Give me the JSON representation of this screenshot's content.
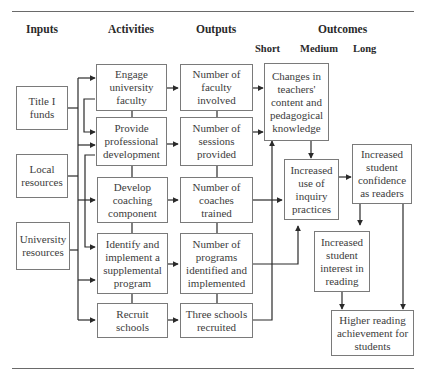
{
  "headers": {
    "inputs": "Inputs",
    "activities": "Activities",
    "outputs": "Outputs",
    "outcomes": "Outcomes",
    "short": "Short",
    "medium": "Medium",
    "long": "Long"
  },
  "inputs": [
    {
      "label": "Title I funds"
    },
    {
      "label": "Local resources"
    },
    {
      "label": "University resources"
    }
  ],
  "activities": [
    {
      "label": "Engage university faculty"
    },
    {
      "label": "Provide professional development"
    },
    {
      "label": "Develop coaching component"
    },
    {
      "label": "Identify and implement a supplemental program"
    },
    {
      "label": "Recruit schools"
    }
  ],
  "outputs": [
    {
      "label": "Number of faculty involved"
    },
    {
      "label": "Number of sessions provided"
    },
    {
      "label": "Number of coaches trained"
    },
    {
      "label": "Number of programs identified and implemented"
    },
    {
      "label": "Three schools recruited"
    }
  ],
  "outcomes": {
    "short": {
      "label": "Changes in teachers' content and pedagogical knowledge"
    },
    "medium": {
      "label": "Increased use of inquiry practices"
    },
    "long_confidence": {
      "label": "Increased student confidence as readers"
    },
    "long_interest": {
      "label": "Increased student interest in reading"
    },
    "long_achievement": {
      "label": "Higher reading achievement for students"
    }
  }
}
